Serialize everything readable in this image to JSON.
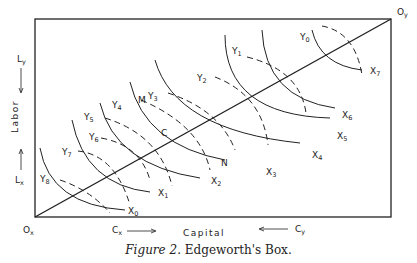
{
  "figure": {
    "caption_prefix": "Figure 2.",
    "caption_title": "Edgeworth's Box.",
    "origins": {
      "x": "O",
      "x_sub": "x",
      "y": "O",
      "y_sub": "y"
    },
    "axes": {
      "horizontal_label": "Capital",
      "vertical_label": "Labor",
      "capital_x": "C",
      "capital_x_sub": "x",
      "capital_y": "C",
      "capital_y_sub": "y",
      "labor_x": "L",
      "labor_x_sub": "x",
      "labor_y": "L",
      "labor_y_sub": "y"
    },
    "x_isoquants": [
      {
        "label": "X",
        "sub": "0"
      },
      {
        "label": "X",
        "sub": "1"
      },
      {
        "label": "X",
        "sub": "2"
      },
      {
        "label": "X",
        "sub": "3"
      },
      {
        "label": "X",
        "sub": "4"
      },
      {
        "label": "X",
        "sub": "5"
      },
      {
        "label": "X",
        "sub": "6"
      },
      {
        "label": "X",
        "sub": "7"
      }
    ],
    "y_isoquants": [
      {
        "label": "Y",
        "sub": "0"
      },
      {
        "label": "Y",
        "sub": "1"
      },
      {
        "label": "Y",
        "sub": "2"
      },
      {
        "label": "Y",
        "sub": "3"
      },
      {
        "label": "Y",
        "sub": "4"
      },
      {
        "label": "Y",
        "sub": "5"
      },
      {
        "label": "Y",
        "sub": "6"
      },
      {
        "label": "Y",
        "sub": "7"
      },
      {
        "label": "Y",
        "sub": "8"
      }
    ],
    "points": {
      "c": "C",
      "m": "M",
      "n": "N"
    },
    "contract_curve": "diagonal from Ox to Oy"
  }
}
